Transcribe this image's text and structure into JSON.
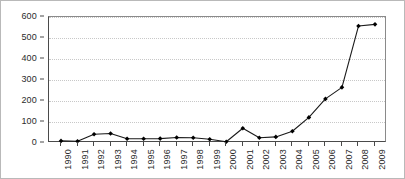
{
  "chart_data": {
    "type": "line",
    "title": "",
    "subtitle": "",
    "xlabel": "",
    "ylabel": "",
    "categories": [
      "1990",
      "1991",
      "1992",
      "1993",
      "1994",
      "1995",
      "1996",
      "1997",
      "1998",
      "1999",
      "2000",
      "2001",
      "2002",
      "2003",
      "2004",
      "2005",
      "2006",
      "2007",
      "2008",
      "2009"
    ],
    "values": [
      10,
      8,
      42,
      45,
      20,
      20,
      21,
      26,
      25,
      18,
      6,
      70,
      25,
      29,
      56,
      122,
      210,
      265,
      557,
      565
    ],
    "series": [
      {
        "name": "",
        "values": [
          10,
          8,
          42,
          45,
          20,
          20,
          21,
          26,
          25,
          18,
          6,
          70,
          25,
          29,
          56,
          122,
          210,
          265,
          557,
          565
        ]
      }
    ],
    "ylim": [
      0,
      600
    ],
    "ytick_labels": [
      "0",
      "100",
      "200",
      "300",
      "400",
      "500",
      "600"
    ],
    "ytick_values": [
      0,
      100,
      200,
      300,
      400,
      500,
      600
    ],
    "grid": true,
    "grid_axis": "y",
    "legend": false,
    "legend_position": "none",
    "marker": "filled-diamond",
    "line_color": "#1a1a1a",
    "marker_color": "#000000",
    "grid_color": "#c8c8c8",
    "axis_color": "#4a4a4a",
    "background_color": "#ffffff",
    "annotations": []
  }
}
